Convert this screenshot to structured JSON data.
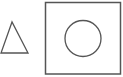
{
  "canvas": {
    "width": 123,
    "height": 77,
    "background": "#ffffff"
  },
  "stroke_color": "#555555",
  "shapes": {
    "triangle": {
      "type": "triangle",
      "points": "12,22 1,53 28,53",
      "stroke": "#555555",
      "stroke_width": 1.3
    },
    "square": {
      "type": "rectangle",
      "x": 45.5,
      "y": 2.5,
      "width": 75,
      "height": 71.5,
      "stroke": "#555555",
      "stroke_width": 1.5
    },
    "circle": {
      "type": "circle",
      "cx": 83,
      "cy": 38.5,
      "r": 18,
      "stroke": "#555555",
      "stroke_width": 1.3
    }
  }
}
